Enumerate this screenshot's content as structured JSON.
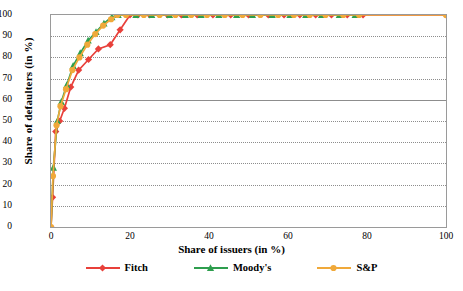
{
  "chart_data": {
    "type": "line",
    "title": "",
    "xlabel": "Share of issuers (in %)",
    "ylabel": "Share of defaulters (in %)",
    "xlim": [
      0,
      100
    ],
    "ylim": [
      0,
      100
    ],
    "xticks": [
      0,
      20,
      40,
      60,
      80,
      100
    ],
    "yticks": [
      0,
      10,
      20,
      30,
      40,
      50,
      60,
      70,
      80,
      90,
      100
    ],
    "grid": "horizontal-dotted",
    "legend_position": "bottom",
    "series": [
      {
        "name": "Fitch",
        "color": "#e8403a",
        "marker": "diamond",
        "x": [
          0,
          0.4,
          1.2,
          2.2,
          3.4,
          5.0,
          7.0,
          9.5,
          12.0,
          15.0,
          17.5,
          20.0,
          22.0,
          25.0,
          29.5,
          33.0,
          37.0,
          41.0,
          45.5,
          50.0,
          55.0,
          59.0,
          63.0,
          67.0,
          71.0,
          75.0,
          79.0,
          100.0
        ],
        "y": [
          0,
          14,
          45,
          50,
          56,
          66,
          74,
          79,
          84,
          86,
          93,
          100,
          100,
          100,
          100,
          100,
          100,
          100,
          100,
          100,
          100,
          100,
          100,
          100,
          100,
          100,
          100,
          100
        ]
      },
      {
        "name": "Moody's",
        "color": "#2e9e4e",
        "marker": "triangle",
        "x": [
          0,
          0.6,
          1.6,
          2.6,
          4.0,
          5.6,
          7.4,
          9.4,
          11.4,
          13.4,
          15.4,
          17.0,
          21.5,
          25.5,
          30.0,
          34.0,
          38.0,
          42.5,
          47.0,
          51.0,
          56.0,
          60.5,
          64.5,
          68.5,
          73.0,
          77.0
        ],
        "y": [
          0,
          28,
          50,
          59,
          67,
          76,
          82,
          88,
          92,
          96,
          99,
          100,
          100,
          100,
          100,
          100,
          100,
          100,
          100,
          100,
          100,
          100,
          100,
          100,
          100,
          100
        ]
      },
      {
        "name": "S&P",
        "color": "#f0a93a",
        "marker": "circle",
        "x": [
          0,
          0.5,
          1.4,
          2.4,
          3.8,
          5.4,
          7.2,
          9.2,
          11.2,
          13.2,
          15.2,
          16.8,
          19.0,
          23.5,
          27.5,
          31.5,
          35.5,
          39.5,
          44.0,
          48.5,
          53.0,
          57.5,
          61.5,
          65.5,
          69.5,
          74.0,
          78.0,
          100.0
        ],
        "y": [
          0,
          24,
          48,
          57,
          65,
          74,
          80,
          86,
          91,
          95,
          98,
          100,
          100,
          100,
          100,
          100,
          100,
          100,
          100,
          100,
          100,
          100,
          100,
          100,
          100,
          100,
          100,
          100
        ]
      }
    ]
  },
  "legend": {
    "items": [
      {
        "label": "Fitch"
      },
      {
        "label": "Moody's"
      },
      {
        "label": "S&P"
      }
    ]
  }
}
